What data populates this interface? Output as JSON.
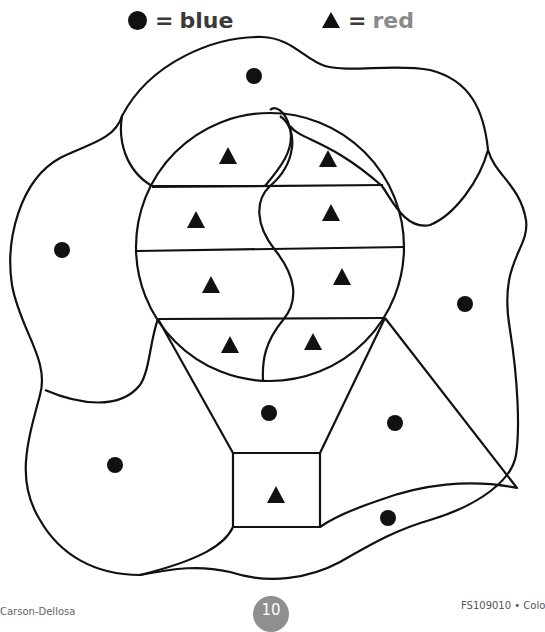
{
  "legend": {
    "blue": {
      "symbol": "circle",
      "equals": "=",
      "label": "blue",
      "color": "#3a3a3a"
    },
    "red": {
      "symbol": "triangle",
      "equals": "=",
      "label": "red",
      "color": "#8a8a8a"
    }
  },
  "worksheet": {
    "subject": "hot air balloon color-by-shape picture",
    "circle_marker_count": 9,
    "triangle_marker_count": 9,
    "circles": [
      {
        "x": 254,
        "y": 76
      },
      {
        "x": 62,
        "y": 250
      },
      {
        "x": 465,
        "y": 304
      },
      {
        "x": 269,
        "y": 413
      },
      {
        "x": 395,
        "y": 423
      },
      {
        "x": 115,
        "y": 465
      },
      {
        "x": 388,
        "y": 518
      }
    ],
    "triangles": [
      {
        "x": 228,
        "y": 156
      },
      {
        "x": 328,
        "y": 159
      },
      {
        "x": 196,
        "y": 220
      },
      {
        "x": 331,
        "y": 213
      },
      {
        "x": 211,
        "y": 285
      },
      {
        "x": 342,
        "y": 277
      },
      {
        "x": 230,
        "y": 345
      },
      {
        "x": 313,
        "y": 342
      },
      {
        "x": 276,
        "y": 495
      }
    ]
  },
  "footer": {
    "left_text": "Carson-Dellosa",
    "page_number": "10",
    "right_text": "FS109010 • Colo"
  }
}
